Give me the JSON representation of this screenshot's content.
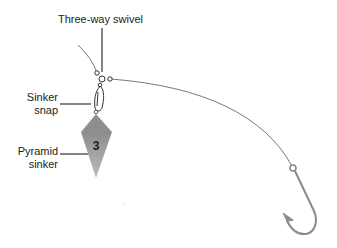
{
  "diagram": {
    "labels": {
      "three_way_swivel": "Three-way swivel",
      "sinker_snap_line1": "Sinker",
      "sinker_snap_line2": "snap",
      "pyramid_sinker_line1": "Pyramid",
      "pyramid_sinker_line2": "sinker"
    },
    "sinker_weight_marking": "3",
    "colors": {
      "background": "#ffffff",
      "text": "#222222",
      "leader_lines": "#333333",
      "fishing_line": "#555555",
      "hook": "#8a8a8a",
      "sinker_light": "#b8b8b8",
      "sinker_dark": "#8c8c8c"
    }
  }
}
